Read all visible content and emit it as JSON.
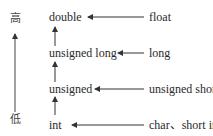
{
  "diagram": {
    "scale": {
      "high": "高",
      "low": "低"
    },
    "chain": [
      "double",
      "unsigned long",
      "unsigned",
      "int"
    ],
    "sources": [
      "float",
      "long",
      "unsigned short",
      "char、short int"
    ],
    "colors": {
      "line": "#333333",
      "text": "#2a2a2a"
    }
  }
}
